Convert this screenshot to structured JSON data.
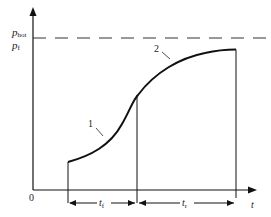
{
  "diagram": {
    "type": "pressure-time curve",
    "y_axis_labels": {
      "p_hot_main": "p",
      "p_hot_sub": "hot",
      "p_f_main": "p",
      "p_f_sub": "f"
    },
    "x_axis_label": "t",
    "origin_label": "0",
    "curve_labels": {
      "segment_1": "1",
      "segment_2": "2"
    },
    "intervals": {
      "t_f_main": "t",
      "t_f_sub": "f",
      "t_r_main": "t",
      "t_r_sub": "r"
    },
    "colors": {
      "line": "#111111",
      "dashed": "#333333"
    }
  }
}
